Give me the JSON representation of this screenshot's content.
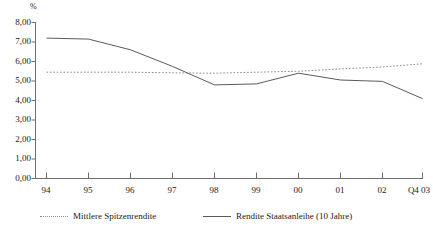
{
  "chart_data": {
    "type": "line",
    "title": "",
    "subtitle": "",
    "xlabel": "",
    "ylabel": "%",
    "ylim": [
      0,
      8
    ],
    "ytick_labels": [
      "0,00",
      "1,00",
      "2,00",
      "3,00",
      "4,00",
      "5,00",
      "6,00",
      "7,00",
      "8,00"
    ],
    "ytick_values": [
      0,
      1,
      2,
      3,
      4,
      5,
      6,
      7,
      8
    ],
    "grid": false,
    "legend_position": "bottom",
    "categories": [
      "94",
      "95",
      "96",
      "97",
      "98",
      "99",
      "00",
      "01",
      "02",
      "Q4 03"
    ],
    "series": [
      {
        "name": "Mittlere Spitzenrendite",
        "style": "dotted",
        "color": "#8a8a8a",
        "values": [
          5.45,
          5.45,
          5.45,
          5.42,
          5.4,
          5.45,
          5.5,
          5.62,
          5.72,
          5.88
        ]
      },
      {
        "name": "Rendite Staatsanleihe (10 Jahre)",
        "style": "solid",
        "color": "#5a5a5a",
        "values": [
          7.2,
          7.15,
          6.6,
          5.75,
          4.8,
          4.85,
          5.4,
          5.05,
          4.98,
          4.1
        ]
      }
    ]
  },
  "legend": {
    "items": [
      {
        "label": "Mittlere Spitzenrendite",
        "marker": "dotted-line-marker"
      },
      {
        "label": "Rendite Staatsanleihe (10 Jahre)",
        "marker": "solid-line-marker"
      }
    ]
  },
  "axis": {
    "unit_label": "%"
  },
  "colors": {
    "axis": "#6e6e6e",
    "text": "#1a1a1a",
    "series_solid": "#5a5a5a",
    "series_dotted": "#8a8a8a",
    "background": "#ffffff"
  }
}
